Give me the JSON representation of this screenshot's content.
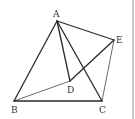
{
  "diagram": {
    "type": "geometry",
    "points": {
      "A": {
        "label": "A",
        "x": 57,
        "y": 21
      },
      "B": {
        "label": "B",
        "x": 14,
        "y": 101
      },
      "C": {
        "label": "C",
        "x": 102,
        "y": 101
      },
      "D": {
        "label": "D",
        "x": 70,
        "y": 81
      },
      "E": {
        "label": "E",
        "x": 114,
        "y": 40
      }
    },
    "segments": [
      {
        "from": "A",
        "to": "B",
        "weight": "thick"
      },
      {
        "from": "A",
        "to": "C",
        "weight": "thick"
      },
      {
        "from": "B",
        "to": "C",
        "weight": "thick"
      },
      {
        "from": "A",
        "to": "E",
        "weight": "thick"
      },
      {
        "from": "A",
        "to": "D",
        "weight": "thick"
      },
      {
        "from": "D",
        "to": "E",
        "weight": "thick"
      },
      {
        "from": "B",
        "to": "D",
        "weight": "thin"
      },
      {
        "from": "C",
        "to": "E",
        "weight": "thin"
      }
    ],
    "labels": {
      "A": "A",
      "B": "B",
      "C": "C",
      "D": "D",
      "E": "E"
    }
  }
}
